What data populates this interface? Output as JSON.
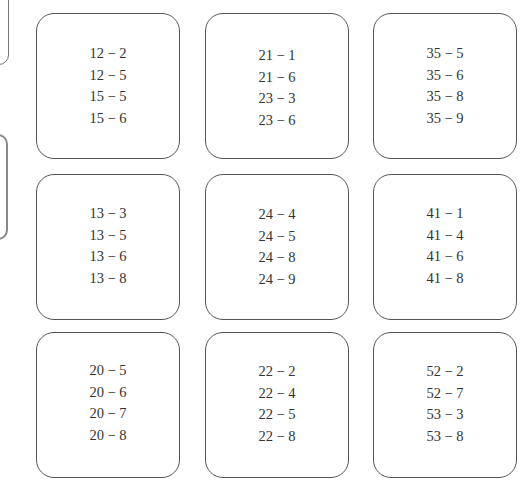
{
  "cards": [
    {
      "problems": [
        "12 − 2",
        "12 − 5",
        "15 − 5",
        "15 − 6"
      ]
    },
    {
      "problems": [
        "21 − 1",
        "21 − 6",
        "23 − 3",
        "23 − 6"
      ]
    },
    {
      "problems": [
        "35 − 5",
        "35 − 6",
        "35 − 8",
        "35 − 9"
      ]
    },
    {
      "problems": [
        "13 − 3",
        "13 − 5",
        "13 − 6",
        "13 − 8"
      ]
    },
    {
      "problems": [
        "24 − 4",
        "24 − 5",
        "24 − 8",
        "24 − 9"
      ]
    },
    {
      "problems": [
        "41 − 1",
        "41 − 4",
        "41 − 6",
        "41 − 8"
      ]
    },
    {
      "problems": [
        "20 − 5",
        "20 − 6",
        "20 − 7",
        "20 − 8"
      ]
    },
    {
      "problems": [
        "22 − 2",
        "22 − 4",
        "22 − 5",
        "22 − 8"
      ]
    },
    {
      "problems": [
        "52 − 2",
        "52 − 7",
        "53 − 3",
        "53 − 8"
      ]
    }
  ]
}
